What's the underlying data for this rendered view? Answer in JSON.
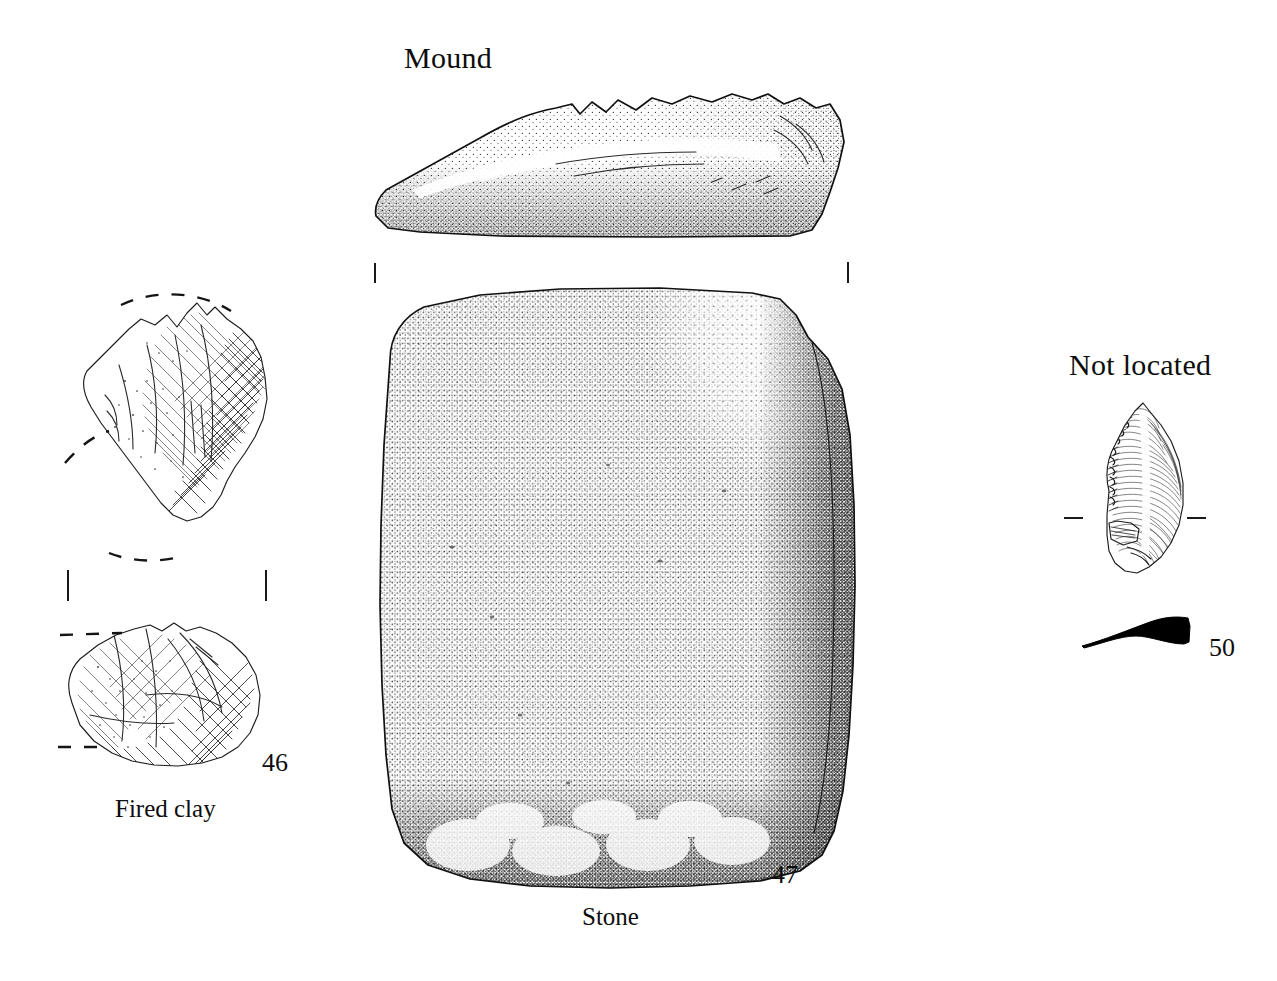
{
  "plate": {
    "background_color": "#ffffff",
    "ink_color": "#111111",
    "width": 1277,
    "height": 981
  },
  "headings": {
    "mound": "Mound",
    "not_located": "Not located"
  },
  "captions": {
    "fired_clay": "Fired clay",
    "stone": "Stone"
  },
  "catalogue_numbers": {
    "fired_clay": "46",
    "stone": "47",
    "flint": "50"
  },
  "figures": [
    {
      "id": "fired-clay-upper",
      "material": "Fired clay",
      "catalogue_number": "46",
      "view": "fragment with reconstructed profile",
      "group": "Mound"
    },
    {
      "id": "fired-clay-lower",
      "material": "Fired clay",
      "catalogue_number": "46",
      "view": "fragment with reconstructed profile",
      "group": "Mound"
    },
    {
      "id": "stone-profile",
      "material": "Stone",
      "catalogue_number": "47",
      "view": "side profile",
      "group": "Mound"
    },
    {
      "id": "stone-plan",
      "material": "Stone",
      "catalogue_number": "47",
      "view": "plan / face",
      "group": "Mound"
    },
    {
      "id": "flint-tool",
      "material": "Flint",
      "catalogue_number": "50",
      "view": "face and section",
      "group": "Not located"
    }
  ],
  "registration_marks": {
    "stone_left": "vertical tick",
    "stone_right": "vertical tick",
    "clay_left": "vertical tick",
    "clay_right": "vertical tick",
    "flint_left": "horizontal tick",
    "flint_right": "horizontal tick"
  }
}
